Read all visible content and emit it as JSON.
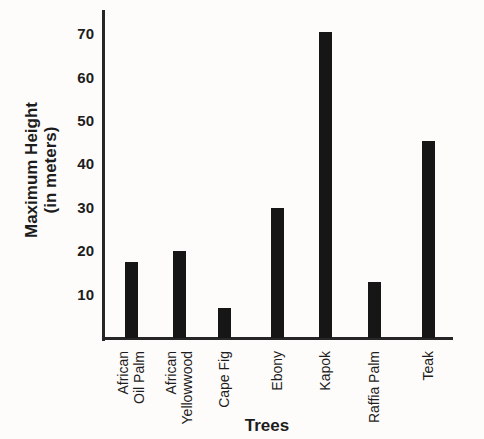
{
  "chart_data": {
    "type": "bar",
    "title": "",
    "categories": [
      "African Oil Palm",
      "African Yellowwood",
      "Cape Fig",
      "Ebony",
      "Kapok",
      "Raffia Palm",
      "Teak"
    ],
    "category_labels": [
      "African\nOil Palm",
      "African\nYellowwood",
      "Cape Fig",
      "Ebony",
      "Kapok",
      "Raffia Palm",
      "Teak"
    ],
    "values": [
      17.5,
      20,
      7,
      30,
      70.5,
      13,
      45.5
    ],
    "unit": "meters",
    "xlabel": "Trees",
    "ylabel": "Maximum Height (in meters)",
    "ylabel_display": "Maximum Height\n(in meters)",
    "yticks": [
      10,
      20,
      30,
      40,
      50,
      60,
      70
    ],
    "ylim": [
      0,
      75
    ],
    "grid": false,
    "legend": "none",
    "bar_color": "#161616",
    "axis_color": "#262626",
    "text_color": "#1d1d1d",
    "background_color": "#fdfcfa"
  }
}
